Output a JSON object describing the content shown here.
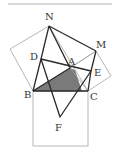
{
  "figure": {
    "type": "geometry",
    "colors": {
      "shade": "#7a7a7a",
      "thick_line": "#2a2a2a",
      "thin_line": "#9a9a9a",
      "rule": "#b0b0b0"
    },
    "points": {
      "N": [
        49,
        26
      ],
      "M": [
        96,
        51
      ],
      "D": [
        41,
        59
      ],
      "A": [
        70,
        68
      ],
      "E": [
        91,
        71
      ],
      "B": [
        33,
        91
      ],
      "C": [
        88,
        91
      ],
      "F": [
        60,
        117
      ],
      "P_left": [
        10,
        49
      ],
      "P_right": [
        111,
        76
      ],
      "Q_bl": [
        33,
        146
      ],
      "Q_br": [
        88,
        146
      ]
    },
    "labels": [
      {
        "id": "N",
        "text": "N",
        "x": 45,
        "y": 20
      },
      {
        "id": "M",
        "text": "M",
        "x": 96,
        "y": 48
      },
      {
        "id": "D",
        "text": "D",
        "x": 30,
        "y": 60
      },
      {
        "id": "A",
        "text": "A",
        "x": 68,
        "y": 65
      },
      {
        "id": "E",
        "text": "E",
        "x": 94,
        "y": 76
      },
      {
        "id": "B",
        "text": "B",
        "x": 24,
        "y": 98
      },
      {
        "id": "C",
        "text": "C",
        "x": 90,
        "y": 100
      },
      {
        "id": "F",
        "text": "F",
        "x": 55,
        "y": 131
      }
    ]
  }
}
